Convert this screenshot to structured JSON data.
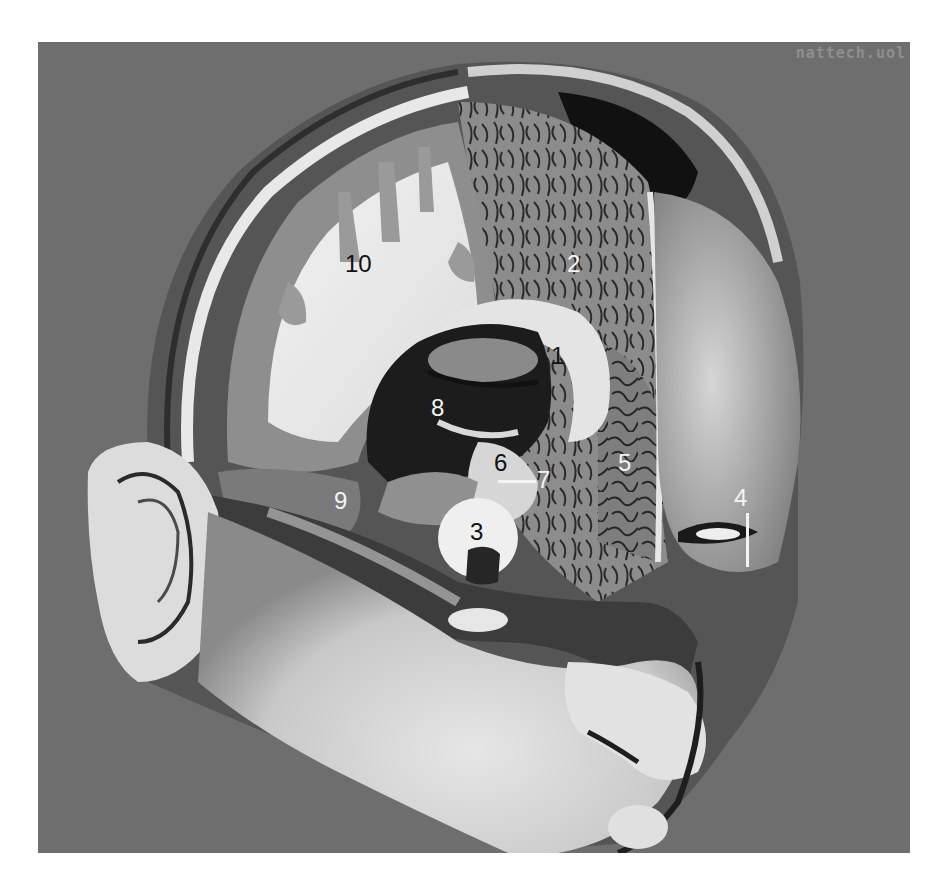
{
  "figure": {
    "watermark": "nattech.uol",
    "background_color": "#6e6e6e",
    "labels": [
      {
        "id": "1",
        "text": "1",
        "tone": "dark"
      },
      {
        "id": "2",
        "text": "2",
        "tone": "light"
      },
      {
        "id": "3",
        "text": "3",
        "tone": "dark"
      },
      {
        "id": "4",
        "text": "4",
        "tone": "light"
      },
      {
        "id": "5",
        "text": "5",
        "tone": "light"
      },
      {
        "id": "6",
        "text": "6",
        "tone": "dark"
      },
      {
        "id": "7",
        "text": "7",
        "tone": "light"
      },
      {
        "id": "8",
        "text": "8",
        "tone": "light"
      },
      {
        "id": "9",
        "text": "9",
        "tone": "light"
      },
      {
        "id": "10",
        "text": "10",
        "tone": "dark"
      }
    ]
  }
}
